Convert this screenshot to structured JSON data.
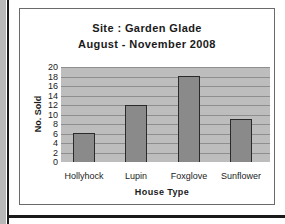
{
  "chart_data": {
    "type": "bar",
    "title": "Site : Garden Glade",
    "subtitle": "August - November 2008",
    "categories": [
      "Hollyhock",
      "Lupin",
      "Foxglove",
      "Sunflower"
    ],
    "values": [
      6,
      12,
      18,
      9
    ],
    "xlabel": "House Type",
    "ylabel": "No. Sold",
    "ylim": [
      0,
      20
    ],
    "yticks": [
      "20",
      "18",
      "16",
      "14",
      "12",
      "10",
      "8",
      "6",
      "4",
      "2",
      "0"
    ],
    "grid": true,
    "legend": null,
    "colors": {
      "plot_background": "#bdbdbd",
      "bar_fill": "#8a8a8a",
      "bar_border": "#2a2a2a",
      "gridline": "#8e8e8e"
    }
  }
}
